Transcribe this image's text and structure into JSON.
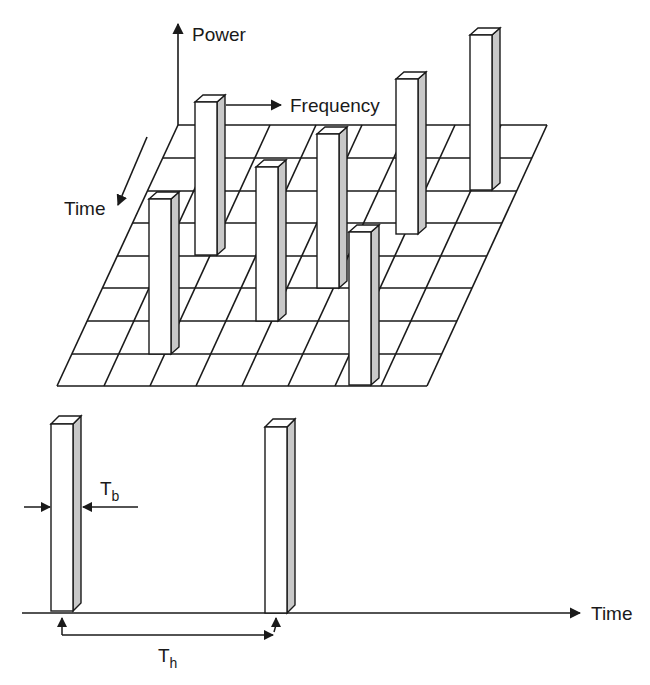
{
  "figure": {
    "type": "frequency-hopping-diagram",
    "top_panel": {
      "axes": {
        "power_label": "Power",
        "frequency_label": "Frequency",
        "time_label": "Time"
      },
      "grid": {
        "rows": 8,
        "columns": 8
      },
      "bars_count": 7
    },
    "bottom_panel": {
      "axis_label": "Time",
      "bit_duration_label": "T",
      "bit_duration_subscript": "b",
      "hop_duration_label": "T",
      "hop_duration_subscript": "h"
    }
  },
  "colors": {
    "line": "#1a1a1a",
    "bar_face": "#ffffff",
    "bar_side": "#c8c8c8",
    "background": "#ffffff"
  }
}
